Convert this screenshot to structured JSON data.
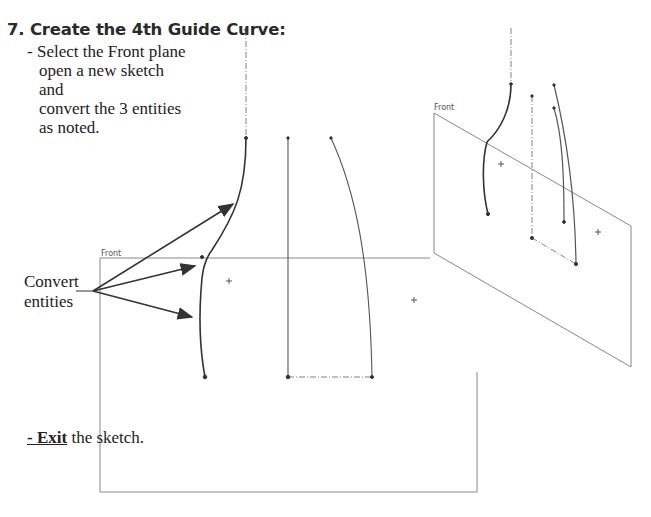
{
  "heading": "7. Create the 4th Guide Curve:",
  "instruction": {
    "bullet": "- ",
    "lines": [
      "Select the Front plane",
      "open a new sketch and",
      "convert the 3 entities",
      "as noted."
    ]
  },
  "callout": {
    "lines": [
      "Convert",
      "entities"
    ]
  },
  "exit_step": {
    "bullet": "- ",
    "bold_word": "Exit",
    "rest": " the sketch."
  },
  "main_view": {
    "plane_label": "Front"
  },
  "iso_view": {
    "plane_label": "Front"
  },
  "colors": {
    "text": "#222222",
    "plane": "#888888",
    "curve": "#333333"
  }
}
